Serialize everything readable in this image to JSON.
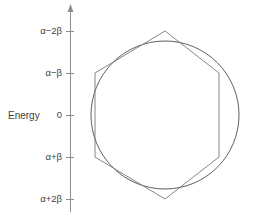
{
  "chart_data": {
    "type": "scatter",
    "title": "",
    "subtitle": "",
    "xlabel": "",
    "ylabel": "Energy",
    "grid": false,
    "legend": null,
    "axis": {
      "orientation": "vertical",
      "has_arrow_head": true,
      "x_px": 70,
      "top_px": 5,
      "bottom_px": 212
    },
    "ticks": [
      {
        "label": "α−2β",
        "value": 2,
        "y_px": 31
      },
      {
        "label": "α−β",
        "value": 1,
        "y_px": 73
      },
      {
        "label": "0",
        "value": 0,
        "y_px": 115
      },
      {
        "label": "α+β",
        "value": -1,
        "y_px": 157
      },
      {
        "label": "α+2β",
        "value": -2,
        "y_px": 199
      }
    ],
    "ylim": [
      -2.4,
      2.4
    ],
    "circle": {
      "name": "frost-circle",
      "cx_px": 165,
      "cy_px": 115,
      "r_px": 74,
      "color": "#4d4d4d"
    },
    "polygon": {
      "name": "benzene-hexagon",
      "sides": 6,
      "orientation": "vertex-up",
      "color": "#777777",
      "vertices_px": [
        [
          165,
          31
        ],
        [
          219,
          73
        ],
        [
          219,
          157
        ],
        [
          165,
          199
        ],
        [
          95,
          157
        ],
        [
          95,
          73
        ]
      ],
      "energy_levels": [
        {
          "label": "α−2β",
          "value": 2,
          "degeneracy": 1
        },
        {
          "label": "α−β",
          "value": 1,
          "degeneracy": 2
        },
        {
          "label": "α+β",
          "value": -1,
          "degeneracy": 2
        },
        {
          "label": "α+2β",
          "value": -2,
          "degeneracy": 1
        }
      ]
    }
  },
  "labels": {
    "energy_axis_title": "Energy",
    "tick_alpha_minus_2beta": "α−2β",
    "tick_alpha_minus_beta": "α−β",
    "tick_zero": "0",
    "tick_alpha_plus_beta": "α+β",
    "tick_alpha_plus_2beta": "α+2β"
  },
  "colors": {
    "background": "#ffffff",
    "axis": "#8c8c8c",
    "circle": "#4d4d4d",
    "polygon": "#777777",
    "text": "#3f3f3f"
  }
}
